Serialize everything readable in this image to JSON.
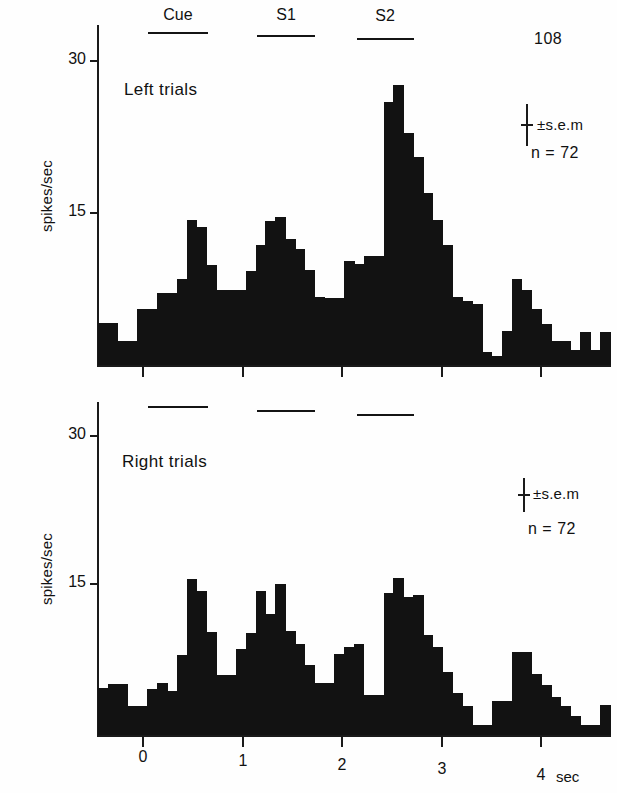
{
  "figure": {
    "id_number": "108",
    "background": "#fefefe",
    "ink_color": "#121212"
  },
  "axis": {
    "y_label": "spikes/sec",
    "y_ticks": [
      "30",
      "15"
    ],
    "y_tick_values": [
      30,
      15
    ],
    "x_ticks": [
      "0",
      "1",
      "2",
      "3",
      "4"
    ],
    "x_tick_values": [
      0,
      1,
      2,
      3,
      4
    ],
    "x_unit_label": "sec"
  },
  "events": {
    "labels": [
      "Cue",
      "S1",
      "S2"
    ],
    "bars": [
      {
        "label": "Cue",
        "start_sec": 0.05,
        "end_sec": 0.65
      },
      {
        "label": "S1",
        "start_sec": 1.15,
        "end_sec": 1.73
      },
      {
        "label": "S2",
        "start_sec": 2.15,
        "end_sec": 2.72
      }
    ]
  },
  "panels": [
    {
      "name": "left-trials",
      "title": "Left trials",
      "sem_label": "±s.e.m",
      "n_label": "n = 72"
    },
    {
      "name": "right-trials",
      "title": "Right trials",
      "sem_label": "±s.e.m",
      "n_label": "n = 72"
    }
  ],
  "chart_data": [
    {
      "type": "bar",
      "name": "left-trials-psth",
      "title": "Left trials",
      "xlabel": "sec",
      "ylabel": "spikes/sec",
      "xlim": [
        -0.45,
        4.7
      ],
      "ylim": [
        0,
        31
      ],
      "bin_sec": 0.1,
      "grid": false,
      "legend": "none",
      "annotations": [
        "108",
        "±s.e.m",
        "n = 72",
        "Cue",
        "S1",
        "S2"
      ],
      "x": [
        -0.45,
        -0.35,
        -0.25,
        -0.15,
        -0.05,
        0.05,
        0.15,
        0.25,
        0.35,
        0.45,
        0.55,
        0.65,
        0.75,
        0.85,
        0.95,
        1.05,
        1.15,
        1.25,
        1.35,
        1.45,
        1.55,
        1.65,
        1.75,
        1.85,
        1.95,
        2.05,
        2.15,
        2.25,
        2.35,
        2.45,
        2.55,
        2.65,
        2.75,
        2.85,
        2.95,
        3.05,
        3.15,
        3.25,
        3.35,
        3.45,
        3.55,
        3.65,
        3.75,
        3.85,
        3.95,
        4.05,
        4.15,
        4.25,
        4.35,
        4.45,
        4.55,
        4.65
      ],
      "values": [
        4.1,
        4.1,
        2.4,
        2.4,
        5.5,
        5.5,
        7.1,
        7.1,
        8.5,
        14.3,
        13.6,
        9.9,
        7.4,
        7.4,
        7.4,
        9.3,
        11.8,
        14.2,
        14.6,
        12.4,
        11.5,
        9.4,
        6.7,
        6.6,
        6.6,
        10.3,
        10.0,
        10.8,
        10.8,
        26.0,
        27.6,
        22.9,
        20.5,
        17.0,
        14.3,
        11.8,
        6.7,
        6.3,
        6.0,
        1.3,
        0.9,
        3.4,
        8.5,
        7.4,
        5.5,
        4.0,
        2.4,
        2.4,
        1.5,
        3.3,
        1.5,
        3.3
      ]
    },
    {
      "type": "bar",
      "name": "right-trials-psth",
      "title": "Right trials",
      "xlabel": "sec",
      "ylabel": "spikes/sec",
      "xlim": [
        -0.45,
        4.7
      ],
      "ylim": [
        0,
        31
      ],
      "bin_sec": 0.1,
      "grid": false,
      "legend": "none",
      "annotations": [
        "±s.e.m",
        "n = 72",
        "Cue",
        "S1",
        "S2"
      ],
      "x": [
        -0.45,
        -0.35,
        -0.25,
        -0.15,
        -0.05,
        0.05,
        0.15,
        0.25,
        0.35,
        0.45,
        0.55,
        0.65,
        0.75,
        0.85,
        0.95,
        1.05,
        1.15,
        1.25,
        1.35,
        1.45,
        1.55,
        1.65,
        1.75,
        1.85,
        1.95,
        2.05,
        2.15,
        2.25,
        2.35,
        2.45,
        2.55,
        2.65,
        2.75,
        2.85,
        2.95,
        3.05,
        3.15,
        3.25,
        3.35,
        3.45,
        3.55,
        3.65,
        3.75,
        3.85,
        3.95,
        4.05,
        4.15,
        4.25,
        4.35,
        4.45,
        4.55,
        4.65
      ],
      "values": [
        4.7,
        5.2,
        5.2,
        2.9,
        2.9,
        4.6,
        5.3,
        4.4,
        8.1,
        15.8,
        14.5,
        10.4,
        6.1,
        6.1,
        8.7,
        10.3,
        14.5,
        12.2,
        15.3,
        10.5,
        9.2,
        7.1,
        5.3,
        5.3,
        8.2,
        8.9,
        9.2,
        4.0,
        4.0,
        14.3,
        15.9,
        13.9,
        14.1,
        10.1,
        8.9,
        6.4,
        4.2,
        2.9,
        1.0,
        1.0,
        3.4,
        3.4,
        8.4,
        8.4,
        6.2,
        5.1,
        3.8,
        2.9,
        1.9,
        1.0,
        1.0,
        3.0
      ]
    }
  ]
}
